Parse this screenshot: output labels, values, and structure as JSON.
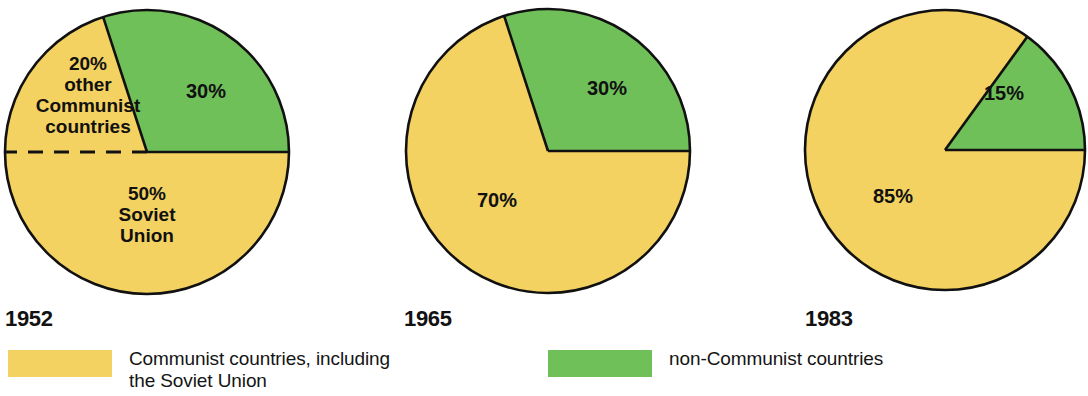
{
  "figure": {
    "title": "",
    "background": "#ffffff"
  },
  "colors": {
    "communist": "#F4D262",
    "non_communist": "#70C05A",
    "outline": "#111111",
    "text": "#141414"
  },
  "chart_data": {
    "type": "pie",
    "title": "",
    "legend_position": "bottom",
    "series_names": [
      "Communist countries, including the Soviet Union",
      "non-Communist countries"
    ],
    "charts": [
      {
        "year": "1952",
        "center": [
          147,
          152
        ],
        "radius": 142,
        "slices": [
          {
            "name": "non-Communist countries",
            "value": 30,
            "label": "30%",
            "color_key": "non_communist",
            "start_deg": -18,
            "end_deg": 90,
            "label_pos": [
              206,
              98
            ]
          },
          {
            "name": "Soviet Union",
            "value": 50,
            "label": "50%\nSoviet\nUnion",
            "color_key": "communist",
            "start_deg": 90,
            "end_deg": 270,
            "label_pos": [
              147,
              200
            ]
          },
          {
            "name": "other Communist countries",
            "value": 20,
            "label": "20%\nother\nCommunist\ncountries",
            "color_key": "communist",
            "start_deg": 270,
            "end_deg": 342,
            "label_pos": [
              88,
              70
            ]
          }
        ],
        "divider": {
          "style": "dashed",
          "from_deg": 270,
          "note": "dashed line separating Soviet Union from other Communist countries"
        }
      },
      {
        "year": "1965",
        "center": [
          548,
          151
        ],
        "radius": 142,
        "slices": [
          {
            "name": "non-Communist countries",
            "value": 30,
            "label": "30%",
            "color_key": "non_communist",
            "start_deg": -18,
            "end_deg": 90,
            "label_pos": [
              607,
              95
            ]
          },
          {
            "name": "Communist countries, including the Soviet Union",
            "value": 70,
            "label": "70%",
            "color_key": "communist",
            "start_deg": 90,
            "end_deg": 342,
            "label_pos": [
              497,
              207
            ]
          }
        ],
        "divider": null
      },
      {
        "year": "1983",
        "center": [
          945,
          150
        ],
        "radius": 140,
        "slices": [
          {
            "name": "non-Communist countries",
            "value": 15,
            "label": "15%",
            "color_key": "non_communist",
            "start_deg": 36,
            "end_deg": 90,
            "label_pos": [
              1004,
              100
            ]
          },
          {
            "name": "Communist countries, including the Soviet Union",
            "value": 85,
            "label": "85%",
            "color_key": "communist",
            "start_deg": 90,
            "end_deg": 396,
            "label_pos": [
              893,
              203
            ]
          }
        ],
        "divider": null
      }
    ]
  },
  "year_labels": [
    {
      "text": "1952",
      "x": 5,
      "y": 306
    },
    {
      "text": "1965",
      "x": 404,
      "y": 306
    },
    {
      "text": "1983",
      "x": 805,
      "y": 306
    }
  ],
  "legend": {
    "items": [
      {
        "label": "Communist countries, including\nthe Soviet Union",
        "color_key": "communist",
        "x": 8,
        "y": 0
      },
      {
        "label": "non-Communist countries",
        "color_key": "non_communist",
        "x": 548,
        "y": 0
      }
    ]
  }
}
